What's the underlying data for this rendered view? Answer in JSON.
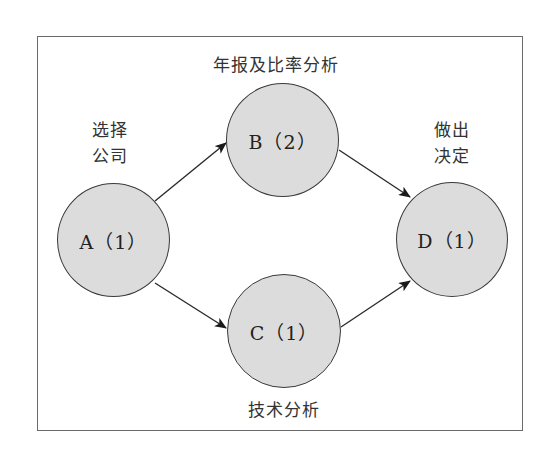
{
  "diagram": {
    "type": "network",
    "nodes": [
      {
        "id": "A",
        "label": "A（1）",
        "annotation": "选择\n公司",
        "annotation_lines": [
          "选择",
          "公司"
        ]
      },
      {
        "id": "B",
        "label": "B（2）",
        "annotation": "年报及比率分析"
      },
      {
        "id": "C",
        "label": "C（1）",
        "annotation": "技术分析"
      },
      {
        "id": "D",
        "label": "D（1）",
        "annotation": "做出\n决定",
        "annotation_lines": [
          "做出",
          "决定"
        ]
      }
    ],
    "edges": [
      {
        "from": "A",
        "to": "B"
      },
      {
        "from": "A",
        "to": "C"
      },
      {
        "from": "B",
        "to": "D"
      },
      {
        "from": "C",
        "to": "D"
      }
    ],
    "colors": {
      "node_fill": "#dcdcdc",
      "node_stroke": "#3a3a3a",
      "edge": "#2a2a2a",
      "frame": "#6a6a6a"
    }
  }
}
